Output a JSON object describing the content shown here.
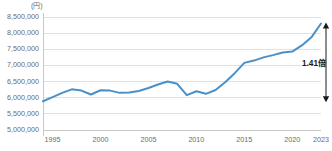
{
  "chart_data": {
    "type": "line",
    "title": "",
    "subtitle": "",
    "xlabel": "",
    "ylabel": "",
    "unit_label": "(円)",
    "grid": true,
    "legend": false,
    "xlim": [
      1994,
      2023
    ],
    "ylim": [
      5000000,
      8500000
    ],
    "y_ticks": [
      "8,500,000",
      "8,000,000",
      "7,500,000",
      "7,000,000",
      "6,500,000",
      "6,000,000",
      "5,500,000",
      "5,000,000"
    ],
    "y_tick_values": [
      8500000,
      8000000,
      7500000,
      7000000,
      6500000,
      6000000,
      5500000,
      5000000
    ],
    "x_ticks": [
      "1995",
      "2000",
      "2005",
      "2010",
      "2015",
      "2020",
      "2023"
    ],
    "x_tick_values": [
      1995,
      2000,
      2005,
      2010,
      2015,
      2020,
      2023
    ],
    "series": [
      {
        "name": "",
        "color": "#4a90c8",
        "x": [
          1994,
          1995,
          1996,
          1997,
          1998,
          1999,
          2000,
          2001,
          2002,
          2003,
          2004,
          2005,
          2006,
          2007,
          2008,
          2009,
          2010,
          2011,
          2012,
          2013,
          2014,
          2015,
          2016,
          2017,
          2018,
          2019,
          2020,
          2021,
          2022,
          2023
        ],
        "values": [
          5890000,
          6020000,
          6150000,
          6260000,
          6220000,
          6100000,
          6230000,
          6220000,
          6150000,
          6160000,
          6210000,
          6300000,
          6410000,
          6500000,
          6430000,
          6080000,
          6200000,
          6120000,
          6240000,
          6480000,
          6760000,
          7080000,
          7150000,
          7250000,
          7320000,
          7400000,
          7430000,
          7620000,
          7870000,
          8300000
        ]
      }
    ],
    "annotations": [
      {
        "name": "ratio-annotation",
        "text": "1.41倍",
        "arrow": "double-headed-vertical",
        "x_year": 2023,
        "y_top": 8300000,
        "y_bottom": 5890000,
        "color": "#1a1a1a"
      }
    ],
    "colors": {
      "line": "#4a90c8",
      "grid": "#e2e2e2",
      "axis": "#c8c8c8",
      "text": "#6b6b6b",
      "annotation": "#1a1a1a",
      "background": "#ffffff"
    }
  }
}
